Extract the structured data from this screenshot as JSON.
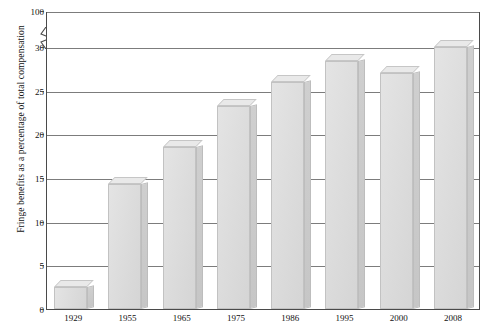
{
  "chart_data": {
    "type": "bar",
    "title": "",
    "xlabel": "",
    "ylabel": "Fringe benefits as a percentage of total compensation",
    "categories": [
      "1929",
      "1955",
      "1965",
      "1975",
      "1986",
      "1995",
      "2000",
      "2008"
    ],
    "values": [
      2.5,
      14.3,
      18.5,
      23.2,
      26.0,
      28.4,
      27.0,
      30.0
    ],
    "ylim": [
      0,
      100
    ],
    "yticks": [
      0,
      5,
      10,
      15,
      20,
      25,
      30,
      100
    ],
    "ytick_labels": [
      "0",
      "5",
      "10",
      "15",
      "20",
      "25",
      "30",
      "100"
    ],
    "axis_break": {
      "present": true,
      "between": [
        30,
        100
      ],
      "symbol": "zigzag"
    },
    "grid": true,
    "grid_axis": "y",
    "legend": null,
    "series": [
      {
        "name": "Fringe benefits",
        "values": [
          2.5,
          14.3,
          18.5,
          23.2,
          26.0,
          28.4,
          27.0,
          30.0
        ]
      }
    ],
    "bar_style": "3d-shaded",
    "colors": {
      "bar_face": "#dddddd",
      "bar_side": "#cacaca",
      "bar_top": "#e9e9e9",
      "bar_edge": "#c2c2c2",
      "gridline": "#7c7c7c",
      "frame": "#4a4a4a",
      "text": "#111111",
      "background": "#ffffff"
    }
  }
}
